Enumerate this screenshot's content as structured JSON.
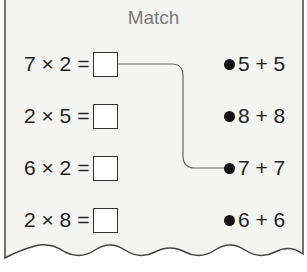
{
  "title": "Match",
  "equations": [
    {
      "expr": "7 × 2 =",
      "answer_box": ""
    },
    {
      "expr": "2 × 5 =",
      "answer_box": ""
    },
    {
      "expr": "6 × 2 =",
      "answer_box": ""
    },
    {
      "expr": "2 × 8 =",
      "answer_box": ""
    }
  ],
  "answers": [
    {
      "text": "5 + 5"
    },
    {
      "text": "8 + 8"
    },
    {
      "text": "7 + 7"
    },
    {
      "text": "6 + 6"
    }
  ],
  "connections": [
    {
      "from_equation": 0,
      "to_answer": 2
    }
  ],
  "colors": {
    "paper": "#f4f4f2",
    "border": "#444444",
    "title": "#7a7a7a",
    "line": "#666666"
  }
}
